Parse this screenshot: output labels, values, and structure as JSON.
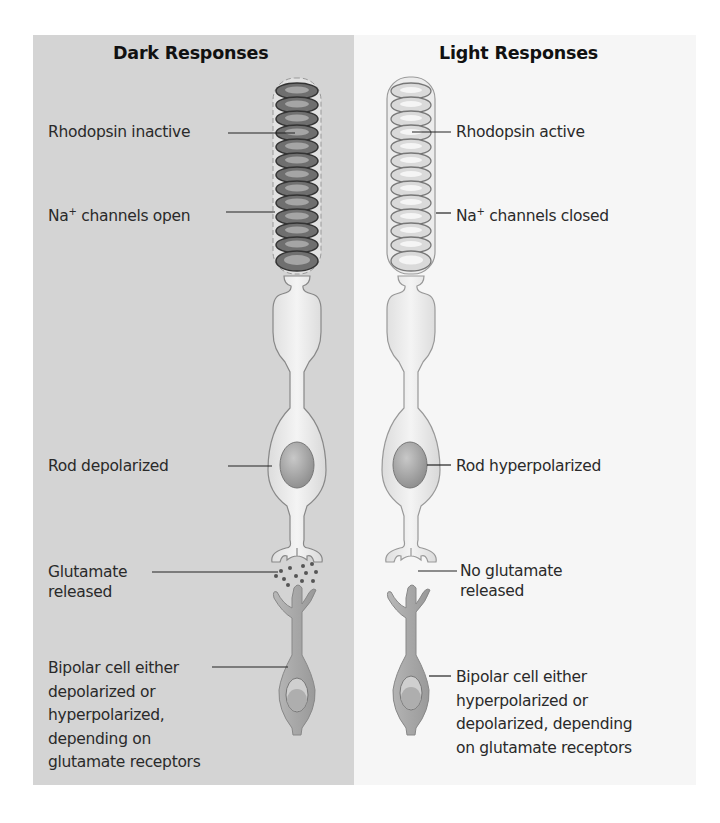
{
  "figure": {
    "panels": {
      "dark": {
        "title": "Dark Responses",
        "background": "#d4d4d4",
        "labels": {
          "rhodopsin": "Rhodopsin inactive",
          "na_prefix": "Na",
          "na_sup": "+",
          "na_rest": " channels open",
          "rod": "Rod depolarized",
          "glutamate_1": "Glutamate",
          "glutamate_2": "released",
          "bipolar_1": "Bipolar cell either",
          "bipolar_2": "depolarized or",
          "bipolar_3": "hyperpolarized,",
          "bipolar_4": "depending on",
          "bipolar_5": "glutamate receptors"
        }
      },
      "light": {
        "title": "Light Responses",
        "background": "#f6f6f6",
        "labels": {
          "rhodopsin": "Rhodopsin active",
          "na_prefix": "Na",
          "na_sup": "+",
          "na_rest": " channels closed",
          "rod": "Rod hyperpolarized",
          "glutamate_1": "No glutamate",
          "glutamate_2": "released",
          "bipolar_1": "Bipolar cell either",
          "bipolar_2": "hyperpolarized or",
          "bipolar_3": "depolarized, depending",
          "bipolar_4": "on glutamate receptors"
        }
      }
    },
    "colors": {
      "dark_disc": "#6f6f6f",
      "light_disc": "#d9d9d9",
      "cell_body": "#ececec",
      "bipolar": "#a9a9a9",
      "nucleus": "#9a9a9a"
    }
  }
}
